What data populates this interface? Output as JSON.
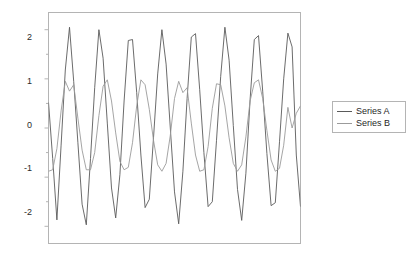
{
  "chart_data": {
    "type": "line",
    "title": "",
    "subtitle": "",
    "xlabel": "",
    "ylabel": "",
    "grid": false,
    "legend_position": "right",
    "xlim": [
      0,
      120
    ],
    "ylim": [
      -2.35,
      2.35
    ],
    "x_tick_labels": [],
    "y_tick_labels": [
      "2",
      "1",
      "0",
      "-1",
      "-2"
    ],
    "y_ticks": [
      2,
      1,
      0,
      -1,
      -2
    ],
    "y_minor_ticks": [
      1.5,
      0.5,
      -0.5,
      -1.5
    ],
    "colors": {
      "series_a": "#5a5a5a",
      "series_b": "#9b9b9b",
      "axis": "#b4b4b4",
      "tick_text": "#2b2b2b",
      "background": "#ffffff"
    },
    "series": [
      {
        "name": "Series A",
        "color": "#5a5a5a",
        "x": [
          0,
          2,
          4,
          6,
          8,
          10,
          12,
          14,
          16,
          18,
          20,
          22,
          24,
          26,
          28,
          30,
          32,
          34,
          36,
          38,
          40,
          42,
          44,
          46,
          48,
          50,
          52,
          54,
          56,
          58,
          60,
          62,
          64,
          66,
          68,
          70,
          72,
          74,
          76,
          78,
          80,
          82,
          84,
          86,
          88,
          90,
          92,
          94,
          96,
          98,
          100,
          102,
          104,
          106,
          108,
          110,
          112,
          114,
          116,
          118,
          120
        ],
        "values": [
          0.52,
          -0.62,
          -1.87,
          -0.35,
          1.18,
          2.05,
          0.95,
          -0.3,
          -1.55,
          -1.97,
          -0.62,
          0.82,
          2.0,
          1.42,
          0.1,
          -1.22,
          -1.83,
          -0.95,
          0.55,
          1.78,
          1.8,
          0.72,
          -0.55,
          -1.62,
          -1.45,
          -0.2,
          1.1,
          2.0,
          1.3,
          0.0,
          -1.3,
          -1.95,
          -0.88,
          0.6,
          1.85,
          1.92,
          0.78,
          -0.5,
          -1.6,
          -1.5,
          -0.25,
          1.05,
          2.05,
          1.38,
          0.05,
          -1.25,
          -1.88,
          -0.92,
          0.58,
          1.8,
          1.88,
          0.75,
          -0.52,
          -1.58,
          -1.52,
          -0.28,
          1.0,
          1.93,
          1.65,
          -0.55,
          -1.6
        ]
      },
      {
        "name": "Series B",
        "color": "#9b9b9b",
        "x": [
          0,
          2,
          4,
          6,
          8,
          10,
          12,
          14,
          16,
          18,
          20,
          22,
          24,
          26,
          28,
          30,
          32,
          34,
          36,
          38,
          40,
          42,
          44,
          46,
          48,
          50,
          52,
          54,
          56,
          58,
          60,
          62,
          64,
          66,
          68,
          70,
          72,
          74,
          76,
          78,
          80,
          82,
          84,
          86,
          88,
          90,
          92,
          94,
          96,
          98,
          100,
          102,
          104,
          106,
          108,
          110,
          112,
          114,
          116,
          118,
          120
        ],
        "values": [
          -0.88,
          -0.85,
          -0.42,
          0.35,
          0.95,
          0.75,
          0.88,
          0.2,
          -0.45,
          -0.85,
          -0.85,
          -0.5,
          0.25,
          0.85,
          0.98,
          0.55,
          -0.1,
          -0.68,
          -0.85,
          -0.8,
          -0.3,
          0.45,
          0.98,
          0.88,
          0.38,
          -0.25,
          -0.75,
          -0.88,
          -0.72,
          -0.15,
          0.6,
          0.95,
          0.72,
          0.82,
          0.1,
          -0.55,
          -0.88,
          -0.85,
          -0.38,
          0.4,
          0.9,
          0.88,
          0.45,
          -0.2,
          -0.72,
          -0.88,
          -0.75,
          -0.18,
          0.55,
          0.92,
          0.98,
          0.6,
          -0.05,
          -0.65,
          -0.88,
          -0.82,
          -0.35,
          0.42,
          0.0,
          0.3,
          0.45
        ]
      }
    ]
  },
  "legend": {
    "entries": [
      {
        "label": "Series A"
      },
      {
        "label": "Series B"
      }
    ]
  }
}
